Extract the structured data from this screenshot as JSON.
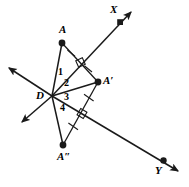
{
  "figure": {
    "type": "geometry-diagram",
    "width": 189,
    "height": 187,
    "stroke_color": "#1a1a1a",
    "background_color": "#ffffff",
    "points": [
      {
        "id": "A",
        "label": "A",
        "x": 62,
        "y": 43,
        "label_x": 59,
        "label_y": 25,
        "dot": true
      },
      {
        "id": "Aprime",
        "label": "A′",
        "x": 98,
        "y": 82,
        "label_x": 104,
        "label_y": 75,
        "dot": true
      },
      {
        "id": "Adouble",
        "label": "A″",
        "x": 63,
        "y": 145,
        "label_x": 58,
        "label_y": 151,
        "dot": true
      },
      {
        "id": "D",
        "label": "D",
        "x": 52,
        "y": 96,
        "label_x": 37,
        "label_y": 90,
        "dot": false
      },
      {
        "id": "X",
        "label": "X",
        "x": 120,
        "y": 22,
        "label_x": 110,
        "label_y": 4,
        "dot": true
      },
      {
        "id": "Y",
        "label": "Y",
        "x": 164,
        "y": 161,
        "label_x": 155,
        "label_y": 160,
        "dot": true
      }
    ],
    "angle_labels": [
      {
        "label": "1",
        "x": 58,
        "y": 67
      },
      {
        "label": "2",
        "x": 64,
        "y": 78
      },
      {
        "label": "3",
        "x": 64,
        "y": 92
      },
      {
        "label": "4",
        "x": 60,
        "y": 103
      }
    ],
    "rays": [
      {
        "id": "ray-DX",
        "from": [
          52,
          96
        ],
        "to": [
          133,
          10
        ],
        "arrow_at_end": true
      },
      {
        "id": "ray-DX-opposite",
        "from": [
          52,
          96
        ],
        "to": [
          6,
          66
        ],
        "arrow_at_end": true
      },
      {
        "id": "ray-DY",
        "from": [
          52,
          96
        ],
        "to": [
          180,
          172
        ],
        "arrow_at_end": true
      },
      {
        "id": "ray-DY-opposite",
        "from": [
          52,
          96
        ],
        "to": [
          20,
          124
        ],
        "arrow_at_end": true
      }
    ],
    "segments": [
      {
        "id": "seg-DA",
        "from": [
          52,
          96
        ],
        "to": [
          62,
          43
        ]
      },
      {
        "id": "seg-DAprime",
        "from": [
          52,
          96
        ],
        "to": [
          98,
          82
        ]
      },
      {
        "id": "seg-DAdouble",
        "from": [
          52,
          96
        ],
        "to": [
          63,
          145
        ]
      },
      {
        "id": "seg-A-Aprime",
        "from": [
          62,
          43
        ],
        "to": [
          98,
          82
        ]
      },
      {
        "id": "seg-Aprime-Adouble",
        "from": [
          98,
          82
        ],
        "to": [
          63,
          145
        ]
      }
    ],
    "congruence_marks": [
      {
        "id": "tick-A-to-mid",
        "on": "seg-A-Aprime",
        "t": 0.26
      },
      {
        "id": "tick-mid-to-Aprime",
        "on": "seg-A-Aprime",
        "t": 0.74
      },
      {
        "id": "tick-Aprime-to-mid2",
        "on": "seg-Aprime-Adouble",
        "t": 0.26
      },
      {
        "id": "tick-mid2-to-Adouble",
        "on": "seg-Aprime-Adouble",
        "t": 0.74
      }
    ],
    "right_angle_marks": [
      {
        "id": "right-angle-AX",
        "x": 80,
        "y": 62
      },
      {
        "id": "right-angle-AY",
        "x": 82,
        "y": 114
      }
    ]
  }
}
